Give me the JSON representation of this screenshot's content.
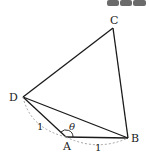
{
  "diagram": {
    "type": "quadrilateral",
    "vertices": {
      "A": {
        "label": "A",
        "x": 66,
        "y": 137
      },
      "B": {
        "label": "B",
        "x": 128,
        "y": 138
      },
      "C": {
        "label": "C",
        "x": 113,
        "y": 28
      },
      "D": {
        "label": "D",
        "x": 23,
        "y": 97
      }
    },
    "edges": [
      "AB",
      "BC",
      "CD",
      "DA",
      "DB"
    ],
    "angle_label": "θ",
    "side_labels": {
      "DA": "1",
      "AB": "1"
    },
    "colors": {
      "line": "#1a1a1a",
      "dashed": "#9a9a9a",
      "header_block": "#6b6b6b"
    }
  }
}
